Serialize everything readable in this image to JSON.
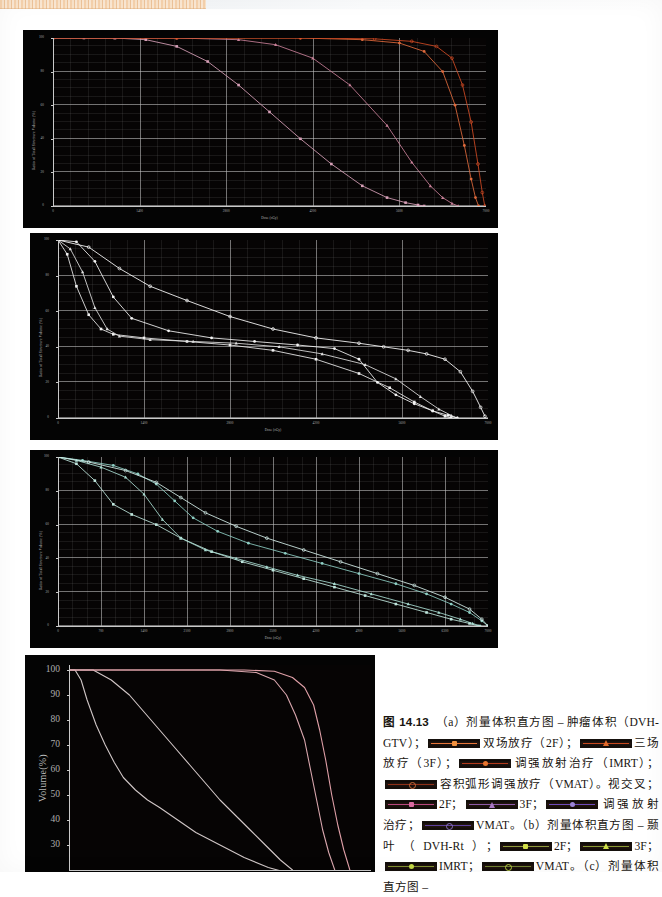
{
  "figure": {
    "number": "图 14.13",
    "caption_runs": [
      {
        "t": "text",
        "v": "图 14.13"
      },
      {
        "t": "text",
        "v": "　（a）剂量体积直方图 – 肿瘤体积（DVH-GTV）；"
      },
      {
        "t": "swatch",
        "line": "#e8763a",
        "marker": "#f0913f",
        "shape": "sq",
        "open": false
      },
      {
        "t": "text",
        "v": "双场放疗（2F）；"
      },
      {
        "t": "swatch",
        "line": "#c7491f",
        "marker": "#e06a2a",
        "shape": "tri",
        "open": false
      },
      {
        "t": "text",
        "v": "三场放疗（3F）；"
      },
      {
        "t": "swatch",
        "line": "#b33a1c",
        "marker": "#e8762f",
        "shape": "ci",
        "open": false
      },
      {
        "t": "text",
        "v": "调强放射治疗（IMRT）；"
      },
      {
        "t": "swatch",
        "line": "#8e2f18",
        "marker": "#c96a3a",
        "shape": "ci",
        "open": true
      },
      {
        "t": "text",
        "v": "容积弧形调强放疗（VMAT）。视交叉；"
      },
      {
        "t": "swatch",
        "line": "#b9477e",
        "marker": "#d96ba0",
        "shape": "sq",
        "open": false
      },
      {
        "t": "text",
        "v": "2F；"
      },
      {
        "t": "swatch",
        "line": "#8d5aa8",
        "marker": "#a878c4",
        "shape": "tri",
        "open": false
      },
      {
        "t": "text",
        "v": "3F；"
      },
      {
        "t": "swatch",
        "line": "#6d4bbb",
        "marker": "#9b84d6",
        "shape": "ci",
        "open": false
      },
      {
        "t": "text",
        "v": "调强放射治疗；"
      },
      {
        "t": "swatch",
        "line": "#5c3f9a",
        "marker": "#8a72c0",
        "shape": "ci",
        "open": true
      },
      {
        "t": "text",
        "v": "VMAT。（b）剂量体积直方图 – 颞叶（DVH-Rt）；"
      },
      {
        "t": "swatch",
        "line": "#8f9a3c",
        "marker": "#d2de4a",
        "shape": "sq",
        "open": false
      },
      {
        "t": "text",
        "v": "2F；"
      },
      {
        "t": "swatch",
        "line": "#8a9a34",
        "marker": "#cfe04a",
        "shape": "tri",
        "open": false
      },
      {
        "t": "text",
        "v": "3F；"
      },
      {
        "t": "swatch",
        "line": "#7f8f30",
        "marker": "#c3d845",
        "shape": "ci",
        "open": false
      },
      {
        "t": "text",
        "v": "IMRT；"
      },
      {
        "t": "swatch",
        "line": "#6f8030",
        "marker": "#b6cc44",
        "shape": "ci",
        "open": true
      },
      {
        "t": "text",
        "v": "VMAT。（c）剂量体积直方图 –"
      }
    ]
  },
  "chart_data": [
    {
      "id": "dvh-gtv",
      "type": "line",
      "title": "",
      "xlabel": "Dose (cGy)",
      "ylabel": "Ratio of Total Structure Volume (%)",
      "xlim": [
        0,
        7000
      ],
      "ylim": [
        0,
        100
      ],
      "xticks": [
        0,
        1400,
        2800,
        4200,
        5600,
        7000
      ],
      "xticklabels": [
        "0",
        "1400",
        "2800",
        "4200",
        "5600",
        "7000"
      ],
      "yticks": [
        0,
        20,
        40,
        60,
        80,
        100
      ],
      "yticklabels": [
        "0",
        "20",
        "40",
        "60",
        "80",
        "100"
      ],
      "grid": true,
      "legend": [
        "2F",
        "3F",
        "IMRT",
        "VMAT"
      ],
      "series": [
        {
          "name": "2F",
          "color": "#d8a0b8",
          "marker": "square",
          "x": [
            0,
            500,
            1000,
            1500,
            2000,
            2500,
            3000,
            3500,
            4000,
            4500,
            5000,
            5400,
            5700,
            5900,
            6000
          ],
          "y": [
            100,
            100,
            100,
            99,
            95,
            86,
            72,
            56,
            40,
            25,
            12,
            5,
            2,
            0.6,
            0
          ]
        },
        {
          "name": "3F",
          "color": "#c98098",
          "marker": "triangle",
          "x": [
            0,
            1000,
            2000,
            3000,
            3600,
            4200,
            4800,
            5400,
            5800,
            6100,
            6300,
            6450,
            6550
          ],
          "y": [
            100,
            100,
            100,
            99,
            96,
            88,
            72,
            48,
            26,
            12,
            5,
            1.5,
            0
          ]
        },
        {
          "name": "IMRT",
          "color": "#e06a3c",
          "marker": "circle",
          "x": [
            0,
            2000,
            4000,
            5000,
            5600,
            6000,
            6300,
            6500,
            6650,
            6760,
            6830,
            6880
          ],
          "y": [
            100,
            100,
            100,
            99,
            97,
            92,
            80,
            60,
            36,
            16,
            5,
            0
          ]
        },
        {
          "name": "VMAT",
          "color": "#d14a24",
          "marker": "circle-open",
          "x": [
            0,
            2000,
            4000,
            5200,
            5800,
            6200,
            6450,
            6620,
            6760,
            6870,
            6940,
            6980
          ],
          "y": [
            100,
            100,
            100,
            99.5,
            98,
            95,
            88,
            72,
            50,
            25,
            8,
            0
          ]
        }
      ]
    },
    {
      "id": "dvh-chiasm",
      "type": "line",
      "title": "",
      "xlabel": "Dose (cGy)",
      "ylabel": "Ratio of Total Structure Volume (%)",
      "xlim": [
        0,
        7000
      ],
      "ylim": [
        0,
        100
      ],
      "xticks": [
        0,
        1400,
        2800,
        4200,
        5600,
        7000
      ],
      "xticklabels": [
        "0",
        "1400",
        "2800",
        "4200",
        "5600",
        "7000"
      ],
      "yticks": [
        0,
        20,
        40,
        60,
        80,
        100
      ],
      "yticklabels": [
        "0",
        "20",
        "40",
        "60",
        "80",
        "100"
      ],
      "grid": true,
      "legend": [
        "2F",
        "3F",
        "IMRT",
        "VMAT"
      ],
      "series": [
        {
          "name": "2F",
          "color": "#efefef",
          "marker": "square",
          "x": [
            0,
            150,
            300,
            500,
            700,
            900,
            1400,
            2100,
            2800,
            3500,
            4200,
            4900,
            5400,
            5800,
            6100,
            6300,
            6400
          ],
          "y": [
            100,
            92,
            74,
            58,
            50,
            47,
            45,
            43,
            41,
            38,
            33,
            25,
            17,
            9,
            4,
            1,
            0
          ]
        },
        {
          "name": "3F",
          "color": "#e0e0e0",
          "marker": "triangle",
          "x": [
            0,
            200,
            400,
            600,
            800,
            1000,
            1500,
            2200,
            2900,
            3600,
            4300,
            5000,
            5500,
            5900,
            6200,
            6400,
            6500
          ],
          "y": [
            100,
            95,
            82,
            62,
            50,
            46,
            44,
            43,
            42,
            40,
            36,
            30,
            22,
            12,
            5,
            1.5,
            0
          ]
        },
        {
          "name": "IMRT",
          "color": "#f5f5f5",
          "marker": "circle",
          "x": [
            0,
            300,
            600,
            900,
            1200,
            1800,
            2500,
            3200,
            3900,
            4500,
            4900,
            5200,
            5500,
            5800,
            6100,
            6350,
            6500
          ],
          "y": [
            100,
            99,
            88,
            68,
            56,
            49,
            45,
            43,
            41,
            39,
            33,
            20,
            13,
            8,
            4,
            1.5,
            0
          ]
        },
        {
          "name": "VMAT",
          "color": "#ffffff",
          "marker": "circle-open",
          "x": [
            0,
            500,
            1000,
            1500,
            2100,
            2800,
            3500,
            4200,
            4900,
            5300,
            5700,
            6000,
            6300,
            6550,
            6750,
            6880,
            6950
          ],
          "y": [
            100,
            96,
            84,
            74,
            66,
            57,
            50,
            45,
            42,
            40,
            38,
            36,
            33,
            26,
            15,
            6,
            1
          ]
        }
      ]
    },
    {
      "id": "dvh-temporal-lobe",
      "type": "line",
      "title": "",
      "xlabel": "Dose (cGy)",
      "ylabel": "Ratio of Total Structure Volume (%)",
      "xlim": [
        0,
        7000
      ],
      "ylim": [
        0,
        100
      ],
      "xticks": [
        0,
        700,
        1400,
        2100,
        2800,
        3500,
        4200,
        4900,
        5600,
        6300,
        7000
      ],
      "xticklabels": [
        "0",
        "700",
        "1400",
        "2100",
        "2800",
        "3500",
        "4200",
        "4900",
        "5600",
        "6300",
        "7000"
      ],
      "yticks": [
        0,
        20,
        40,
        60,
        80,
        100
      ],
      "yticklabels": [
        "0",
        "20",
        "40",
        "60",
        "80",
        "100"
      ],
      "grid": true,
      "legend": [
        "2F",
        "3F",
        "IMRT",
        "VMAT"
      ],
      "series": [
        {
          "name": "2F",
          "color": "#bfe6dd",
          "marker": "square",
          "x": [
            0,
            300,
            600,
            900,
            1200,
            1600,
            2000,
            2500,
            3000,
            3500,
            4000,
            4500,
            5000,
            5500,
            6000,
            6400,
            6700,
            6850
          ],
          "y": [
            100,
            96,
            86,
            72,
            66,
            60,
            52,
            44,
            38,
            33,
            28,
            23,
            18,
            13,
            8,
            4,
            1.5,
            0
          ]
        },
        {
          "name": "3F",
          "color": "#a9ddd2",
          "marker": "triangle",
          "x": [
            0,
            300,
            700,
            1100,
            1400,
            1700,
            2000,
            2400,
            2900,
            3400,
            3900,
            4500,
            5100,
            5700,
            6200,
            6550,
            6750,
            6880
          ],
          "y": [
            100,
            98,
            94,
            88,
            78,
            63,
            52,
            45,
            40,
            35,
            30,
            25,
            19,
            13,
            8,
            4,
            1.5,
            0
          ]
        },
        {
          "name": "IMRT",
          "color": "#8ecfc4",
          "marker": "circle",
          "x": [
            0,
            400,
            900,
            1300,
            1600,
            1900,
            2200,
            2600,
            3100,
            3700,
            4300,
            4900,
            5500,
            6000,
            6400,
            6700,
            6900,
            7000
          ],
          "y": [
            100,
            98,
            95,
            90,
            84,
            74,
            64,
            56,
            49,
            43,
            37,
            31,
            25,
            19,
            13,
            8,
            3,
            0
          ]
        },
        {
          "name": "VMAT",
          "color": "#d7f1ec",
          "marker": "circle-open",
          "x": [
            0,
            500,
            1100,
            1600,
            2000,
            2400,
            2900,
            3400,
            4000,
            4600,
            5200,
            5800,
            6300,
            6700,
            6900,
            7000
          ],
          "y": [
            100,
            97,
            92,
            85,
            76,
            67,
            59,
            52,
            45,
            38,
            31,
            24,
            17,
            10,
            4,
            0
          ]
        }
      ]
    },
    {
      "id": "dvh-bottom",
      "type": "line",
      "title": "",
      "xlabel": "",
      "ylabel": "Volume(%)",
      "xlim": [
        0,
        100
      ],
      "ylim": [
        20,
        102
      ],
      "yticks": [
        100,
        90,
        80,
        70,
        60,
        50,
        40,
        30
      ],
      "yticklabels": [
        "100",
        "90",
        "80",
        "70",
        "60",
        "50",
        "40",
        "30"
      ],
      "grid": false,
      "legend": [
        "2F",
        "3F",
        "IMRT",
        "VMAT"
      ],
      "series": [
        {
          "name": "2F",
          "color": "#cfc6c6",
          "x": [
            0,
            2,
            4,
            6,
            9,
            12,
            15,
            18,
            22,
            26,
            30,
            36,
            42,
            50,
            58,
            66,
            72
          ],
          "y": [
            100,
            100,
            96,
            88,
            78,
            70,
            63,
            57,
            52,
            48,
            45,
            40,
            35,
            30,
            25,
            21,
            19
          ]
        },
        {
          "name": "3F",
          "color": "#d2c7c7",
          "x": [
            0,
            8,
            14,
            20,
            25,
            30,
            35,
            40,
            45,
            50,
            55,
            60,
            65,
            70,
            74
          ],
          "y": [
            100,
            100,
            96,
            90,
            83,
            76,
            69,
            62,
            55,
            48,
            42,
            36,
            30,
            24,
            20
          ]
        },
        {
          "name": "IMRT",
          "color": "#d9a7ae",
          "x": [
            0,
            30,
            50,
            62,
            68,
            72,
            75,
            78,
            80,
            82,
            84,
            86,
            88
          ],
          "y": [
            100,
            100,
            100,
            99,
            96,
            90,
            82,
            72,
            60,
            48,
            36,
            27,
            20
          ]
        },
        {
          "name": "VMAT",
          "color": "#e0a0a8",
          "x": [
            0,
            40,
            58,
            68,
            74,
            78,
            81,
            83,
            85,
            87,
            89,
            91,
            93
          ],
          "y": [
            100,
            100,
            100,
            99.5,
            97,
            93,
            86,
            76,
            64,
            50,
            38,
            28,
            20
          ]
        }
      ]
    }
  ]
}
